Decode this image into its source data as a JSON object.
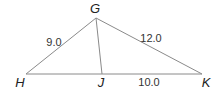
{
  "figure": {
    "type": "triangle-diagram",
    "vertices": [
      {
        "name": "G",
        "x": 96,
        "y": 18,
        "label_x": 95,
        "label_y": 13
      },
      {
        "name": "H",
        "x": 26,
        "y": 74,
        "label_x": 20,
        "label_y": 87
      },
      {
        "name": "J",
        "x": 102,
        "y": 74,
        "label_x": 101,
        "label_y": 87
      },
      {
        "name": "K",
        "x": 202,
        "y": 74,
        "label_x": 206,
        "label_y": 87
      }
    ],
    "segments": [
      {
        "from": "G",
        "to": "H",
        "length_label": "9.0",
        "label_x": 55,
        "label_y": 46
      },
      {
        "from": "G",
        "to": "K",
        "length_label": "12.0",
        "label_x": 151,
        "label_y": 42
      },
      {
        "from": "J",
        "to": "K",
        "length_label": "10.0",
        "label_x": 149,
        "label_y": 85
      },
      {
        "from": "H",
        "to": "J",
        "length_label": "",
        "label_x": 0,
        "label_y": 0
      },
      {
        "from": "G",
        "to": "J",
        "length_label": "",
        "label_x": 0,
        "label_y": 0
      }
    ],
    "colors": {
      "line": "#8a8a8a",
      "text": "#222222"
    }
  }
}
